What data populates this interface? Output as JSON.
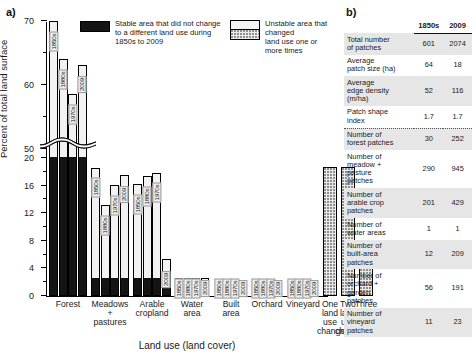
{
  "panels": {
    "a_label": "a)",
    "b_label": "b)"
  },
  "chart_data": {
    "type": "bar",
    "title": "",
    "xlabel": "Land use (land cover)",
    "ylabel": "Percent of total land surface",
    "axis_break": true,
    "ylim_lower": [
      0,
      20
    ],
    "ylim_upper": [
      50,
      70
    ],
    "yticks_lower": [
      0,
      4,
      8,
      12,
      16,
      20
    ],
    "yticks_upper": [
      50,
      60,
      70
    ],
    "grid": false,
    "legend_position": "top",
    "legend": [
      {
        "key": "stable",
        "label": "Stable area that did not change\nto a different land use during\n1850s to 2009",
        "color": "#141414"
      },
      {
        "key": "unstable",
        "label": "Unstable area that changed\nland use one or more times",
        "color": "#f2f2f2"
      }
    ],
    "categories": [
      "Forest",
      "Meadows\n+\npastures",
      "Arable\ncropland",
      "Water\narea",
      "Built\narea",
      "Orchard",
      "Vineyard",
      "One\nland\nuse\nchange",
      "Two\nland\nuse\nchanges",
      "Three\nland\nuse\nchanges"
    ],
    "series_years": [
      "1850s",
      "1880s",
      "1970s",
      "2009"
    ],
    "groups": [
      {
        "category": "Forest",
        "bars": [
          {
            "year": "1850s",
            "total": 70.0,
            "stable": 20.0
          },
          {
            "year": "1880s",
            "total": 64.0,
            "stable": 20.0
          },
          {
            "year": "1970s",
            "total": 58.6,
            "stable": 20.0
          },
          {
            "year": "2009",
            "total": 63.2,
            "stable": 20.0
          }
        ]
      },
      {
        "category": "Meadows + pastures",
        "bars": [
          {
            "year": "1850s",
            "total": 18.6,
            "stable": 2.5
          },
          {
            "year": "1880s",
            "total": 13.2,
            "stable": 2.5
          },
          {
            "year": "1970s",
            "total": 16.1,
            "stable": 2.5
          },
          {
            "year": "2009",
            "total": 17.6,
            "stable": 2.5
          }
        ]
      },
      {
        "category": "Arable cropland",
        "bars": [
          {
            "year": "1850s",
            "total": 16.2,
            "stable": 2.5
          },
          {
            "year": "1880s",
            "total": 17.4,
            "stable": 2.5
          },
          {
            "year": "1970s",
            "total": 17.9,
            "stable": 2.5
          },
          {
            "year": "2009",
            "total": 5.4,
            "stable": 2.5
          }
        ]
      },
      {
        "category": "Water area",
        "bars": [
          {
            "year": "1850s",
            "total": 2.6,
            "stable": 1.9
          },
          {
            "year": "1880s",
            "total": 2.6,
            "stable": 1.9
          },
          {
            "year": "1970s",
            "total": 2.6,
            "stable": 1.9
          },
          {
            "year": "2009",
            "total": 2.6,
            "stable": 1.9
          }
        ]
      },
      {
        "category": "Built area",
        "bars": [
          {
            "year": "1850s",
            "total": 0.9,
            "stable": 0.55
          },
          {
            "year": "1880s",
            "total": 1.1,
            "stable": 0.55
          },
          {
            "year": "1970s",
            "total": 1.5,
            "stable": 0.55
          },
          {
            "year": "2009",
            "total": 2.1,
            "stable": 0.55
          }
        ]
      },
      {
        "category": "Orchard",
        "bars": [
          {
            "year": "1850s",
            "total": 1.3,
            "stable": 0.12
          },
          {
            "year": "1880s",
            "total": 1.6,
            "stable": 0.12
          },
          {
            "year": "1970s",
            "total": 1.1,
            "stable": 0.12
          },
          {
            "year": "2009",
            "total": 1.2,
            "stable": 0.12
          }
        ]
      },
      {
        "category": "Vineyard",
        "bars": [
          {
            "year": "1850s",
            "total": 0.85,
            "stable": 0.1
          },
          {
            "year": "1880s",
            "total": 0.85,
            "stable": 0.1
          },
          {
            "year": "1970s",
            "total": 0.4,
            "stable": 0.1
          },
          {
            "year": "2009",
            "total": 0.35,
            "stable": 0.1
          }
        ]
      },
      {
        "category": "One land use change",
        "bars": [
          {
            "year": "",
            "total": 18.7,
            "stable": 0,
            "dotted": true
          }
        ]
      },
      {
        "category": "Two land use changes",
        "bars": [
          {
            "year": "",
            "total": 18.7,
            "stable": 0,
            "dotted": true
          }
        ]
      },
      {
        "category": "Three land use changes",
        "bars": [
          {
            "year": "",
            "total": 4.0,
            "stable": 0,
            "dotted": true
          }
        ]
      }
    ]
  },
  "table": {
    "columns": [
      "",
      "1850s",
      "2009"
    ],
    "rows": [
      {
        "label": "Total number\n of patches",
        "v1850": "601",
        "v2009": "2074",
        "shade": true
      },
      {
        "label": "Average\n patch size (ha)",
        "v1850": "64",
        "v2009": "18",
        "shade": false
      },
      {
        "label": "Average\n edge density\n (m/ha)",
        "v1850": "52",
        "v2009": "116",
        "shade": true
      },
      {
        "label": "Patch shape\n index",
        "v1850": "1.7",
        "v2009": "1.7",
        "shade": false
      },
      {
        "label": "Number of\n forest patches",
        "v1850": "30",
        "v2009": "252",
        "shade": true,
        "divider": true
      },
      {
        "label": "Number of\n meadow +\n pasture\n patches",
        "v1850": "290",
        "v2009": "945",
        "shade": false
      },
      {
        "label": "Number of\n arable crop\n patches",
        "v1850": "201",
        "v2009": "429",
        "shade": true
      },
      {
        "label": "Number of\n water areas",
        "v1850": "1",
        "v2009": "1",
        "shade": false
      },
      {
        "label": "Number of\n built-area\n patches",
        "v1850": "12",
        "v2009": "209",
        "shade": true
      },
      {
        "label": "Number of\n orchard +\n garden\n patches",
        "v1850": "56",
        "v2009": "191",
        "shade": false
      },
      {
        "label": "Number of\n vineyard\n patches",
        "v1850": "11",
        "v2009": "23",
        "shade": true
      }
    ]
  }
}
